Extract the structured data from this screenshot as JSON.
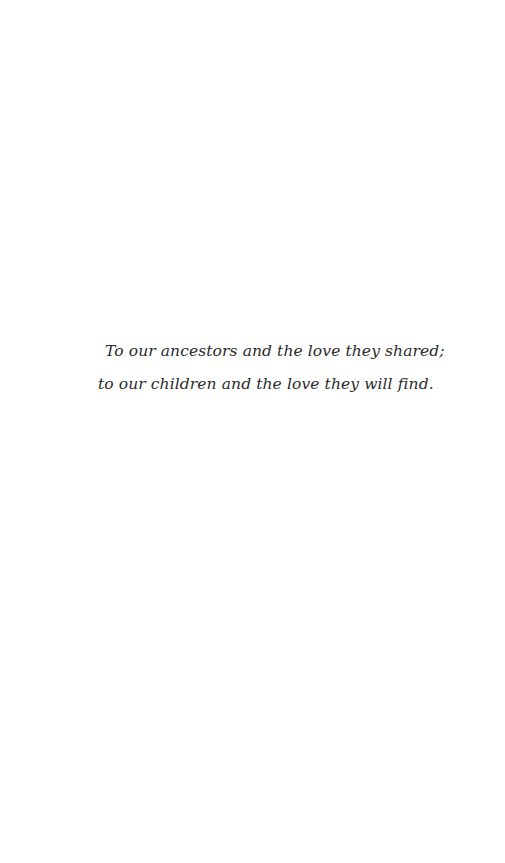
{
  "page": {
    "type": "dedication",
    "dedication": {
      "lines": [
        "To our ancestors and the love they shared;",
        "to our children and the love they will find."
      ]
    }
  }
}
